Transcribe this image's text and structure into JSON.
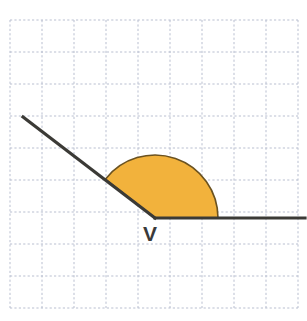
{
  "figure": {
    "type": "geometry-angle-diagram",
    "canvas": {
      "width": 307,
      "height": 321
    },
    "background_color": "#ffffff"
  },
  "grid": {
    "line_color": "#b9bfd0",
    "line_style": "dashed",
    "cell_size": 32,
    "columns": 9,
    "rows": 9,
    "origin_x": 10,
    "origin_y": 20,
    "right_x": 298,
    "bottom_y": 308
  },
  "angle": {
    "vertex_label": "V",
    "vertex_x": 155,
    "vertex_y": 218,
    "measure_degrees": 135,
    "stroke_color": "#3b3a36",
    "stroke_width": 3.2,
    "rays": [
      {
        "name": "horizontal-ray",
        "from_x": 155,
        "from_y": 218,
        "to_x": 305,
        "to_y": 218,
        "direction_degrees": 0
      },
      {
        "name": "upper-left-ray",
        "from_x": 155,
        "from_y": 218,
        "to_x": 23,
        "to_y": 117,
        "direction_degrees": 143
      }
    ]
  },
  "sector": {
    "name": "angle-arc-fill",
    "fill_color": "#f2b23c",
    "stroke_color": "#6b5220",
    "stroke_width": 1.6,
    "radius": 63,
    "start_degrees": 0,
    "end_degrees": 142,
    "center_x": 155,
    "center_y": 218
  },
  "label": {
    "text": "V",
    "x": 143,
    "y": 241,
    "color": "#3a3a3a",
    "font_size": 21,
    "weight": "bold"
  }
}
